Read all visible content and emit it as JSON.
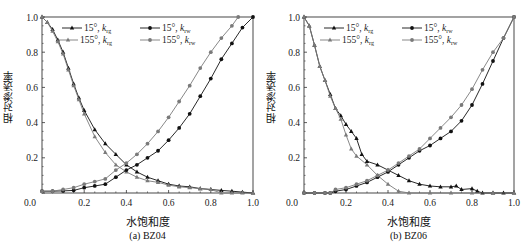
{
  "figure": {
    "panels": [
      {
        "caption": "(a)  BZ04",
        "xlabel": "水饱和度",
        "ylabel": "相对渗透率"
      },
      {
        "caption": "(b)  BZ06",
        "xlabel": "水饱和度",
        "ylabel": "相对渗透率"
      }
    ],
    "legend": [
      {
        "label": "15°, k_rg",
        "main": "15°, k",
        "sub": "rg",
        "color": "#111111",
        "marker": "triangle"
      },
      {
        "label": "15°, k_rw",
        "main": "15°, k",
        "sub": "rw",
        "color": "#111111",
        "marker": "circle"
      },
      {
        "label": "155°, k_rg",
        "main": "155°, k",
        "sub": "rg",
        "color": "#7a7a7a",
        "marker": "triangle"
      },
      {
        "label": "155°, k_rw",
        "main": "155°, k",
        "sub": "rw",
        "color": "#7a7a7a",
        "marker": "circle"
      }
    ],
    "xticks": [
      "0.0",
      "0.2",
      "0.4",
      "0.6",
      "0.8",
      "1.0"
    ],
    "yticks": [
      "0.0",
      "0.2",
      "0.4",
      "0.6",
      "0.8",
      "1.0"
    ]
  },
  "chart_data": [
    {
      "type": "line",
      "title": "(a) BZ04",
      "xlabel": "水饱和度",
      "ylabel": "相对渗透率",
      "xlim": [
        0,
        1
      ],
      "ylim": [
        0,
        1
      ],
      "legend_position": "top-center inside",
      "series": [
        {
          "name": "15°, k_rg",
          "color": "#111111",
          "marker": "triangle",
          "x": [
            0,
            0.025,
            0.05,
            0.075,
            0.1,
            0.125,
            0.15,
            0.175,
            0.2,
            0.25,
            0.3,
            0.35,
            0.4,
            0.45,
            0.5,
            0.55,
            0.6,
            0.65,
            0.7,
            0.75,
            0.8,
            0.85,
            0.9,
            0.95,
            1.0
          ],
          "y": [
            1.0,
            0.97,
            0.93,
            0.87,
            0.8,
            0.71,
            0.62,
            0.54,
            0.47,
            0.36,
            0.28,
            0.22,
            0.16,
            0.12,
            0.09,
            0.07,
            0.05,
            0.04,
            0.035,
            0.025,
            0.02,
            0.015,
            0.01,
            0.005,
            0
          ]
        },
        {
          "name": "155°, k_rg",
          "color": "#7a7a7a",
          "marker": "triangle",
          "x": [
            0,
            0.025,
            0.05,
            0.075,
            0.1,
            0.125,
            0.15,
            0.175,
            0.2,
            0.25,
            0.3,
            0.35,
            0.4,
            0.45,
            0.5,
            0.55,
            0.6,
            0.65,
            0.7,
            0.75,
            0.8,
            0.85,
            0.9,
            0.95,
            1.0
          ],
          "y": [
            1.0,
            0.97,
            0.92,
            0.86,
            0.79,
            0.7,
            0.61,
            0.53,
            0.45,
            0.32,
            0.23,
            0.16,
            0.12,
            0.09,
            0.07,
            0.06,
            0.045,
            0.035,
            0.03,
            0.025,
            0.02,
            0.0,
            0.0,
            0.0,
            0.0
          ]
        },
        {
          "name": "15°, k_rw",
          "color": "#111111",
          "marker": "circle",
          "x": [
            0,
            0.05,
            0.1,
            0.15,
            0.2,
            0.25,
            0.3,
            0.35,
            0.4,
            0.45,
            0.5,
            0.55,
            0.6,
            0.65,
            0.7,
            0.75,
            0.8,
            0.85,
            0.9,
            0.95,
            1.0
          ],
          "y": [
            0.01,
            0.01,
            0.012,
            0.015,
            0.03,
            0.04,
            0.05,
            0.09,
            0.13,
            0.16,
            0.2,
            0.24,
            0.3,
            0.37,
            0.45,
            0.55,
            0.65,
            0.76,
            0.85,
            0.94,
            1.0
          ]
        },
        {
          "name": "155°, k_rw",
          "color": "#7a7a7a",
          "marker": "circle",
          "x": [
            0,
            0.05,
            0.1,
            0.15,
            0.2,
            0.25,
            0.3,
            0.35,
            0.4,
            0.45,
            0.5,
            0.55,
            0.6,
            0.65,
            0.7,
            0.75,
            0.8,
            0.85,
            0.9,
            0.93
          ],
          "y": [
            0.01,
            0.01,
            0.02,
            0.03,
            0.05,
            0.065,
            0.08,
            0.13,
            0.17,
            0.22,
            0.28,
            0.35,
            0.43,
            0.52,
            0.61,
            0.71,
            0.8,
            0.88,
            0.95,
            1.0
          ]
        }
      ]
    },
    {
      "type": "line",
      "title": "(b) BZ06",
      "xlabel": "水饱和度",
      "ylabel": "相对渗透率",
      "xlim": [
        0,
        1
      ],
      "ylim": [
        0,
        1
      ],
      "legend_position": "top-center inside",
      "series": [
        {
          "name": "15°, k_rg",
          "color": "#111111",
          "marker": "triangle",
          "x": [
            0,
            0.025,
            0.05,
            0.075,
            0.1,
            0.125,
            0.15,
            0.175,
            0.2,
            0.225,
            0.25,
            0.275,
            0.3,
            0.35,
            0.4,
            0.45,
            0.5,
            0.55,
            0.6,
            0.65,
            0.7,
            0.725,
            0.75,
            0.8,
            0.825,
            0.85,
            0.9,
            0.95,
            1.0
          ],
          "y": [
            1.0,
            0.95,
            0.84,
            0.72,
            0.64,
            0.56,
            0.48,
            0.44,
            0.39,
            0.35,
            0.31,
            0.22,
            0.18,
            0.16,
            0.13,
            0.1,
            0.07,
            0.05,
            0.04,
            0.035,
            0.035,
            0.04,
            0.02,
            0.025,
            0.01,
            0.0,
            0.0,
            0.0,
            0.0
          ]
        },
        {
          "name": "155°, k_rg",
          "color": "#7a7a7a",
          "marker": "triangle",
          "x": [
            0,
            0.025,
            0.05,
            0.075,
            0.1,
            0.125,
            0.15,
            0.175,
            0.2,
            0.225,
            0.25,
            0.3,
            0.35,
            0.4,
            0.45,
            0.5,
            0.6,
            0.7,
            0.8,
            0.9,
            1.0
          ],
          "y": [
            1.0,
            0.95,
            0.84,
            0.72,
            0.64,
            0.55,
            0.48,
            0.42,
            0.33,
            0.25,
            0.21,
            0.16,
            0.1,
            0.05,
            0.01,
            0.0,
            0.0,
            0.0,
            0.0,
            0.0,
            0.0
          ]
        },
        {
          "name": "15°, k_rw",
          "color": "#111111",
          "marker": "circle",
          "x": [
            0,
            0.05,
            0.1,
            0.125,
            0.15,
            0.2,
            0.25,
            0.3,
            0.35,
            0.4,
            0.45,
            0.5,
            0.55,
            0.6,
            0.65,
            0.7,
            0.75,
            0.8,
            0.85,
            0.9,
            0.95,
            1.0
          ],
          "y": [
            0,
            0,
            0,
            0,
            0.01,
            0.02,
            0.04,
            0.06,
            0.09,
            0.12,
            0.16,
            0.2,
            0.24,
            0.27,
            0.31,
            0.35,
            0.41,
            0.5,
            0.62,
            0.75,
            0.88,
            1.0
          ]
        },
        {
          "name": "155°, k_rw",
          "color": "#7a7a7a",
          "marker": "circle",
          "x": [
            0,
            0.05,
            0.1,
            0.125,
            0.15,
            0.2,
            0.25,
            0.3,
            0.35,
            0.4,
            0.45,
            0.5,
            0.55,
            0.6,
            0.65,
            0.7,
            0.75,
            0.8,
            0.85,
            0.9,
            0.95,
            1.0
          ],
          "y": [
            0,
            0,
            0,
            0,
            0.02,
            0.03,
            0.05,
            0.07,
            0.1,
            0.13,
            0.17,
            0.21,
            0.25,
            0.31,
            0.37,
            0.43,
            0.5,
            0.59,
            0.7,
            0.8,
            0.88,
            1.0
          ]
        }
      ]
    }
  ]
}
